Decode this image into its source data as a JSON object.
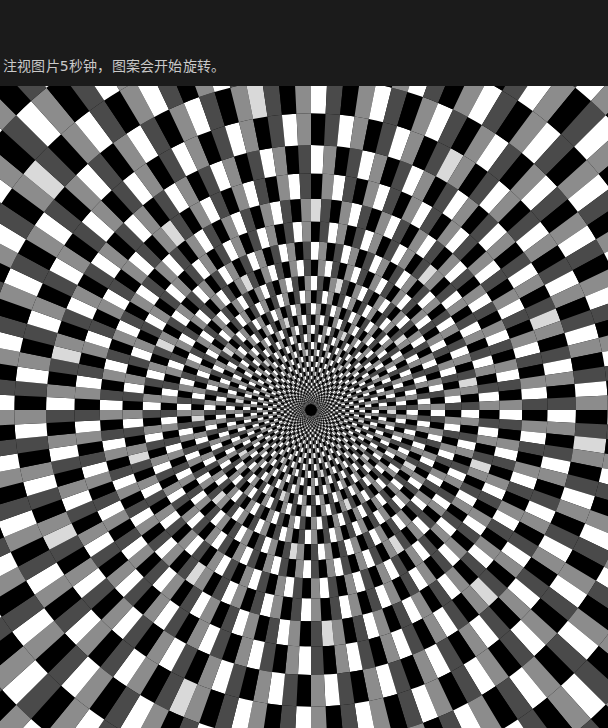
{
  "caption": "注视图片5秒钟，图案会开始旋转。",
  "illusion": {
    "type": "radial-checker-optical-illusion",
    "center": [
      311,
      324
    ],
    "colors": [
      "#ffffff",
      "#8c8c8c",
      "#000000",
      "#4a4a4a"
    ],
    "accent_light": "#d9d9d9",
    "background": "#1b1b1b",
    "spokes": 128,
    "ring_ratio": 1.12,
    "center_dot_color": "#000000"
  }
}
